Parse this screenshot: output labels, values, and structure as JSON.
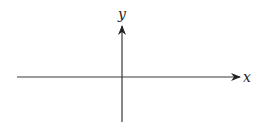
{
  "diagram": {
    "type": "coordinate-axes",
    "x_axis": {
      "label": "x",
      "direction": "right",
      "arrow": true
    },
    "y_axis": {
      "label": "y",
      "direction": "up",
      "arrow": true
    },
    "colors": {
      "axis": "#3a3a3a",
      "label": "#222222",
      "background": "#ffffff"
    }
  }
}
